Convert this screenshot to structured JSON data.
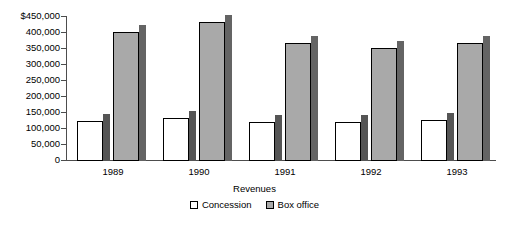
{
  "chart_data": {
    "type": "bar",
    "title": "",
    "xlabel": "Revenues",
    "ylabel": "",
    "categories": [
      "1989",
      "1990",
      "1991",
      "1992",
      "1993"
    ],
    "series": [
      {
        "name": "Concession",
        "color": "#ffffff",
        "values": [
          125000,
          132000,
          122000,
          122000,
          128000
        ]
      },
      {
        "name": "Box office",
        "color": "#a9a9a9",
        "values": [
          400000,
          432000,
          365000,
          352000,
          365000
        ]
      }
    ],
    "ylim": [
      0,
      450000
    ],
    "y_ticks": [
      0,
      50000,
      100000,
      150000,
      200000,
      250000,
      300000,
      350000,
      400000,
      450000
    ],
    "y_tick_labels": [
      "0",
      "50,000",
      "100,000",
      "150,000",
      "200,000",
      "250,000",
      "300,000",
      "350,000",
      "400,000",
      "$450,000"
    ],
    "grid": false,
    "legend_position": "bottom",
    "style": "3d-bar"
  },
  "legend": {
    "entries": [
      {
        "label": "Concession",
        "swatch": "white-square-swatch"
      },
      {
        "label": "Box office",
        "swatch": "gray-square-swatch"
      }
    ]
  },
  "axis": {
    "x_title": "Revenues"
  }
}
